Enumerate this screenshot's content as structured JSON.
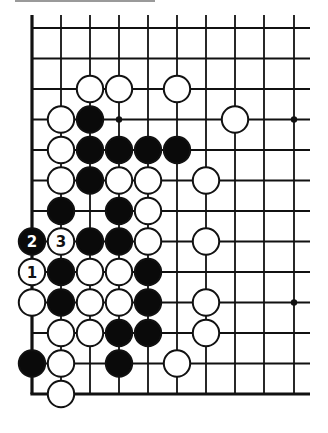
{
  "diagram": {
    "type": "go-board-fragment",
    "colors": {
      "line": "#111111",
      "black_stone": "#0a0a0a",
      "white_stone": "#ffffff",
      "stone_outline": "#111111",
      "topbar": "#9a9a9a"
    },
    "grid": {
      "columns": 10,
      "rows": 13,
      "col_x": [
        32,
        61,
        90,
        119,
        148,
        177,
        206,
        235,
        264,
        294
      ],
      "row_y": [
        28,
        58.5,
        89,
        119.5,
        150,
        180.5,
        211,
        241.5,
        272,
        302.5,
        333,
        363.5,
        394
      ],
      "left_edge": true,
      "bottom_edge": true,
      "top_open": true,
      "right_open": true
    },
    "hoshi": [
      {
        "col": 3,
        "row": 3
      },
      {
        "col": 9,
        "row": 3
      },
      {
        "col": 9,
        "row": 9
      }
    ],
    "stones": [
      {
        "color": "white",
        "col": 2,
        "row": 2
      },
      {
        "color": "white",
        "col": 3,
        "row": 2
      },
      {
        "color": "white",
        "col": 5,
        "row": 2
      },
      {
        "color": "white",
        "col": 1,
        "row": 3
      },
      {
        "color": "black",
        "col": 2,
        "row": 3
      },
      {
        "color": "white",
        "col": 7,
        "row": 3
      },
      {
        "color": "white",
        "col": 1,
        "row": 4
      },
      {
        "color": "black",
        "col": 2,
        "row": 4
      },
      {
        "color": "black",
        "col": 3,
        "row": 4
      },
      {
        "color": "black",
        "col": 4,
        "row": 4
      },
      {
        "color": "black",
        "col": 5,
        "row": 4
      },
      {
        "color": "white",
        "col": 1,
        "row": 5
      },
      {
        "color": "black",
        "col": 2,
        "row": 5
      },
      {
        "color": "white",
        "col": 3,
        "row": 5
      },
      {
        "color": "white",
        "col": 4,
        "row": 5
      },
      {
        "color": "white",
        "col": 6,
        "row": 5
      },
      {
        "color": "black",
        "col": 1,
        "row": 6
      },
      {
        "color": "black",
        "col": 3,
        "row": 6
      },
      {
        "color": "white",
        "col": 4,
        "row": 6
      },
      {
        "color": "black",
        "col": 0,
        "row": 7,
        "label": "2"
      },
      {
        "color": "white",
        "col": 1,
        "row": 7,
        "label": "3"
      },
      {
        "color": "black",
        "col": 2,
        "row": 7
      },
      {
        "color": "black",
        "col": 3,
        "row": 7
      },
      {
        "color": "white",
        "col": 4,
        "row": 7
      },
      {
        "color": "white",
        "col": 6,
        "row": 7
      },
      {
        "color": "white",
        "col": 0,
        "row": 8,
        "label": "1"
      },
      {
        "color": "black",
        "col": 1,
        "row": 8
      },
      {
        "color": "white",
        "col": 2,
        "row": 8
      },
      {
        "color": "white",
        "col": 3,
        "row": 8
      },
      {
        "color": "black",
        "col": 4,
        "row": 8
      },
      {
        "color": "white",
        "col": 0,
        "row": 9
      },
      {
        "color": "black",
        "col": 1,
        "row": 9
      },
      {
        "color": "white",
        "col": 2,
        "row": 9
      },
      {
        "color": "white",
        "col": 3,
        "row": 9
      },
      {
        "color": "black",
        "col": 4,
        "row": 9
      },
      {
        "color": "white",
        "col": 6,
        "row": 9
      },
      {
        "color": "white",
        "col": 1,
        "row": 10
      },
      {
        "color": "white",
        "col": 2,
        "row": 10
      },
      {
        "color": "black",
        "col": 3,
        "row": 10
      },
      {
        "color": "black",
        "col": 4,
        "row": 10
      },
      {
        "color": "white",
        "col": 6,
        "row": 10
      },
      {
        "color": "black",
        "col": 0,
        "row": 11
      },
      {
        "color": "white",
        "col": 1,
        "row": 11
      },
      {
        "color": "black",
        "col": 3,
        "row": 11
      },
      {
        "color": "white",
        "col": 5,
        "row": 11
      },
      {
        "color": "white",
        "col": 1,
        "row": 12
      }
    ],
    "move_labels": [
      "1",
      "2",
      "3"
    ]
  }
}
